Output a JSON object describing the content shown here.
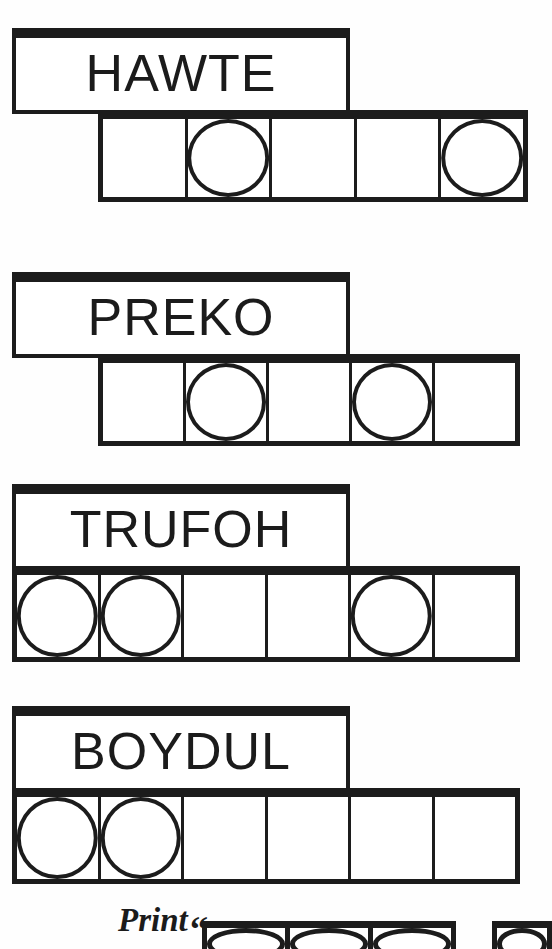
{
  "page": {
    "kind": "word-puzzle-worksheet",
    "ink_color": "#1c1c1c",
    "paper_color": "#fefefe"
  },
  "puzzle_rows": [
    {
      "word": "HAWTE",
      "label_box": {
        "x": 12,
        "y": 28,
        "width": 338,
        "height": 86
      },
      "grid": {
        "x": 98,
        "y": 110,
        "width": 430,
        "height": 92,
        "cells": 5
      },
      "cells": [
        {
          "index": 0,
          "circle": false
        },
        {
          "index": 1,
          "circle": true
        },
        {
          "index": 2,
          "circle": false
        },
        {
          "index": 3,
          "circle": false
        },
        {
          "index": 4,
          "circle": true
        }
      ]
    },
    {
      "word": "PREKO",
      "label_box": {
        "x": 12,
        "y": 272,
        "width": 338,
        "height": 86
      },
      "grid": {
        "x": 98,
        "y": 354,
        "width": 422,
        "height": 92,
        "cells": 5
      },
      "cells": [
        {
          "index": 0,
          "circle": false
        },
        {
          "index": 1,
          "circle": true
        },
        {
          "index": 2,
          "circle": false
        },
        {
          "index": 3,
          "circle": true
        },
        {
          "index": 4,
          "circle": false
        }
      ]
    },
    {
      "word": "TRUFOH",
      "label_box": {
        "x": 12,
        "y": 484,
        "width": 338,
        "height": 86
      },
      "grid": {
        "x": 12,
        "y": 566,
        "width": 508,
        "height": 96,
        "cells": 6
      },
      "cells": [
        {
          "index": 0,
          "circle": true
        },
        {
          "index": 1,
          "circle": true
        },
        {
          "index": 2,
          "circle": false
        },
        {
          "index": 3,
          "circle": false
        },
        {
          "index": 4,
          "circle": true
        },
        {
          "index": 5,
          "circle": false
        }
      ]
    },
    {
      "word": "BOYDUL",
      "label_box": {
        "x": 12,
        "y": 706,
        "width": 338,
        "height": 86
      },
      "grid": {
        "x": 12,
        "y": 788,
        "width": 508,
        "height": 96,
        "cells": 6
      },
      "cells": [
        {
          "index": 0,
          "circle": true
        },
        {
          "index": 1,
          "circle": true
        },
        {
          "index": 2,
          "circle": false
        },
        {
          "index": 3,
          "circle": false
        },
        {
          "index": 4,
          "circle": false
        },
        {
          "index": 5,
          "circle": false
        }
      ]
    }
  ],
  "footer": {
    "print_label": "Print",
    "quote_mark": "“",
    "grids": [
      {
        "x": 202,
        "y": 921,
        "width": 254,
        "height": 28,
        "cells": 3
      },
      {
        "x": 492,
        "y": 921,
        "width": 60,
        "height": 28,
        "cells": 1
      }
    ]
  }
}
